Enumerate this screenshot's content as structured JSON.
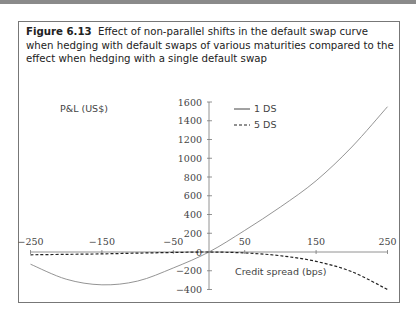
{
  "figure": {
    "number": "Figure 6.13",
    "caption": "Effect of non-parallel shifts in the default swap curve when hedging with default swaps of various maturities compared to the effect when hedging with a single default swap"
  },
  "chart_data": {
    "type": "line",
    "title": "Effect of non-parallel shifts in the default swap curve when hedging with default swaps of various maturities compared to the effect when hedging with a single default swap",
    "xlabel": "Credit spread (bps)",
    "ylabel": "P&L (US$)",
    "xlim": [
      -250,
      250
    ],
    "ylim": [
      -400,
      1600
    ],
    "x_ticks": [
      -250,
      -150,
      -50,
      50,
      150,
      250
    ],
    "y_ticks": [
      -400,
      -200,
      0,
      200,
      400,
      600,
      800,
      1000,
      1200,
      1400,
      1600
    ],
    "grid": false,
    "legend_position": "top-right",
    "x": [
      -250,
      -200,
      -150,
      -100,
      -50,
      0,
      50,
      100,
      150,
      200,
      250
    ],
    "series": [
      {
        "name": "1 DS",
        "style": "solid",
        "values": [
          -130,
          -290,
          -350,
          -310,
          -170,
          0,
          230,
          480,
          760,
          1120,
          1550
        ]
      },
      {
        "name": "5 DS",
        "style": "dashed",
        "values": [
          -30,
          -25,
          -20,
          -12,
          -5,
          0,
          -10,
          -40,
          -100,
          -210,
          -400
        ]
      }
    ]
  }
}
